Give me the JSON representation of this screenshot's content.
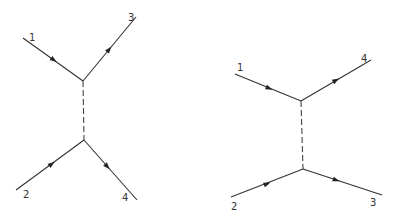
{
  "diagrams": [
    {
      "name": "t-channel-left",
      "vertices": {
        "top": [
          83,
          81
        ],
        "bottom": [
          84,
          140
        ]
      },
      "lines": [
        {
          "label": "1",
          "from": [
            23,
            38
          ],
          "to": [
            83,
            81
          ],
          "label_pos": [
            29,
            38
          ],
          "direction": "in"
        },
        {
          "label": "3",
          "from": [
            83,
            81
          ],
          "to": [
            136,
            17
          ],
          "label_pos": [
            129,
            20
          ],
          "direction": "out"
        },
        {
          "label": "2",
          "from": [
            16,
            190
          ],
          "to": [
            84,
            140
          ],
          "label_pos": [
            24,
            196
          ],
          "direction": "in"
        },
        {
          "label": "4",
          "from": [
            84,
            140
          ],
          "to": [
            137,
            200
          ],
          "label_pos": [
            122,
            200
          ],
          "direction": "out"
        }
      ],
      "propagator": "dashed"
    },
    {
      "name": "t-channel-right",
      "vertices": {
        "top": [
          301,
          101
        ],
        "bottom": [
          303,
          169
        ]
      },
      "lines": [
        {
          "label": "1",
          "from": [
            235,
            74
          ],
          "to": [
            301,
            101
          ],
          "label_pos": [
            237,
            72
          ],
          "direction": "in"
        },
        {
          "label": "4",
          "from": [
            301,
            101
          ],
          "to": [
            371,
            60
          ],
          "label_pos": [
            361,
            62
          ],
          "direction": "out"
        },
        {
          "label": "2",
          "from": [
            231,
            197
          ],
          "to": [
            303,
            169
          ],
          "label_pos": [
            231,
            210
          ],
          "direction": "in"
        },
        {
          "label": "3",
          "from": [
            303,
            169
          ],
          "to": [
            382,
            195
          ],
          "label_pos": [
            370,
            205
          ],
          "direction": "out"
        }
      ],
      "propagator": "dashed"
    }
  ],
  "labels": {
    "left": {
      "l1": "1",
      "l2": "2",
      "l3": "3",
      "l4": "4"
    },
    "right": {
      "l1": "1",
      "l2": "2",
      "l3": "3",
      "l4": "4"
    }
  }
}
